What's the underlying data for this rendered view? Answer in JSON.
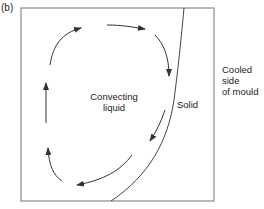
{
  "figure": {
    "panel_label": "(b)",
    "labels": {
      "liquid_line1": "Convecting",
      "liquid_line2": "liquid",
      "solid": "Solid",
      "cooled_line1": "Cooled",
      "cooled_line2": "side",
      "cooled_line3": "of mould"
    },
    "colors": {
      "box": "#8a8a8a",
      "curve": "#444444",
      "arrows": "#333333",
      "text": "#222222"
    },
    "arrows": [
      {
        "name": "top-left-arc",
        "direction": "up-right"
      },
      {
        "name": "top-arrow",
        "direction": "right"
      },
      {
        "name": "right-down-arc",
        "direction": "down"
      },
      {
        "name": "lower-right-diagonal",
        "direction": "down-left"
      },
      {
        "name": "bottom-arc",
        "direction": "left"
      },
      {
        "name": "lower-left-arc",
        "direction": "up"
      },
      {
        "name": "left-up-arrow",
        "direction": "up"
      }
    ]
  }
}
